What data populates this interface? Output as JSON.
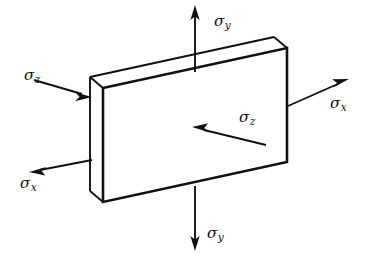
{
  "figure": {
    "type": "engineering-stress-element-diagram",
    "projection": "oblique",
    "background_color": "#ffffff",
    "line_color": "#111111",
    "body": {
      "name": "thin rectangular slab",
      "front_face": [
        [
          103,
          88
        ],
        [
          287,
          48
        ],
        [
          287,
          162
        ],
        [
          103,
          202
        ]
      ],
      "depth_offset": [
        -13,
        -11
      ],
      "visible_faces": [
        "front",
        "top",
        "left-side"
      ]
    },
    "labels": [
      {
        "id": "sigma-y-top",
        "symbol": "σ",
        "subscript": "y",
        "x": 214,
        "y": 14
      },
      {
        "id": "sigma-z-left",
        "symbol": "σ",
        "subscript": "z",
        "x": 24,
        "y": 68
      },
      {
        "id": "sigma-x-right",
        "symbol": "σ",
        "subscript": "x",
        "x": 330,
        "y": 96
      },
      {
        "id": "sigma-z-inner",
        "symbol": "σ",
        "subscript": "z",
        "x": 239,
        "y": 110
      },
      {
        "id": "sigma-x-left",
        "symbol": "σ",
        "subscript": "x",
        "x": 20,
        "y": 176
      },
      {
        "id": "sigma-y-bottom",
        "symbol": "σ",
        "subscript": "y",
        "x": 207,
        "y": 226
      }
    ],
    "arrows": [
      {
        "id": "arrow-sigma-y-top",
        "component": "sigma_y",
        "sense": "tension",
        "tail": [
          195,
          72
        ],
        "head": [
          195,
          8
        ],
        "direction": "up"
      },
      {
        "id": "arrow-sigma-y-bottom",
        "component": "sigma_y",
        "sense": "tension",
        "tail": [
          195,
          186
        ],
        "head": [
          195,
          248
        ],
        "direction": "down"
      },
      {
        "id": "arrow-sigma-x-right",
        "component": "sigma_x",
        "sense": "tension",
        "tail": [
          288,
          106
        ],
        "head": [
          347,
          80
        ],
        "direction": "up-right"
      },
      {
        "id": "arrow-sigma-x-left",
        "component": "sigma_x",
        "sense": "tension",
        "tail": [
          92,
          160
        ],
        "head": [
          31,
          172
        ],
        "direction": "down-left"
      },
      {
        "id": "arrow-sigma-z-left",
        "component": "sigma_z",
        "sense": "compression",
        "tail": [
          34,
          80
        ],
        "head": [
          91,
          97
        ],
        "direction": "right-into-face"
      },
      {
        "id": "arrow-sigma-z-inner",
        "component": "sigma_z",
        "sense": "compression",
        "tail": [
          266,
          145
        ],
        "head": [
          193,
          127
        ],
        "direction": "up-left-onto-face"
      }
    ]
  }
}
